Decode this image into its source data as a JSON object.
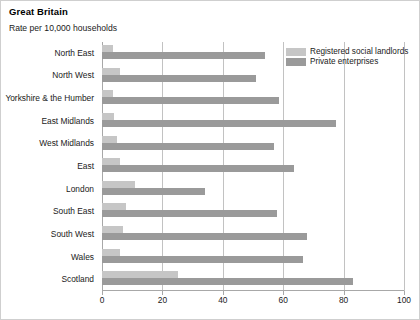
{
  "chart_data": {
    "type": "bar",
    "orientation": "horizontal",
    "title": "Great Britain",
    "subtitle": "Rate per 10,000 households",
    "xlabel": "",
    "ylabel": "",
    "xlim": [
      0,
      100
    ],
    "xticks": [
      0,
      20,
      40,
      60,
      80,
      100
    ],
    "xtick_labels": [
      "0",
      "20",
      "40",
      "60",
      "80",
      "100"
    ],
    "grid": "vertical",
    "legend_position": "top-right",
    "categories": [
      "North East",
      "North West",
      "Yorkshire & the Humber",
      "East Midlands",
      "West Midlands",
      "East",
      "London",
      "South East",
      "South West",
      "Wales",
      "Scotland"
    ],
    "series": [
      {
        "name": "Registered social landlords",
        "color": "#c6c6c6",
        "values": [
          3.5,
          6,
          3.5,
          4,
          5,
          6,
          11,
          8,
          7,
          6,
          25
        ]
      },
      {
        "name": "Private enterprises",
        "color": "#9a9a9a",
        "values": [
          54,
          51,
          58.5,
          77.5,
          57,
          63.5,
          34,
          58,
          68,
          66.5,
          83
        ]
      }
    ]
  }
}
